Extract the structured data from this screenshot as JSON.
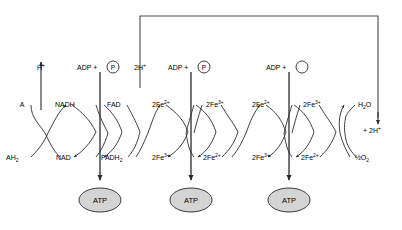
{
  "diagram": {
    "colors": {
      "stroke": "#2a2a2a",
      "atp_fill": "#d4d4d4",
      "atp_stroke": "#3a3a3a",
      "background": "#ffffff",
      "faint_text": "#b9b9b9"
    },
    "top_labels": {
      "proton_out": "H",
      "proton_out_sup": "+",
      "adp1": "ADP +",
      "adp1_circle": "P",
      "two_h": "2H",
      "two_h_sup": "+",
      "adp2": "ADP +",
      "adp2_circle": "P",
      "adp3": "ADP +",
      "adp3_circle": ""
    },
    "upper_row": [
      {
        "name": "A",
        "text": "A",
        "sup": "",
        "sub": ""
      },
      {
        "name": "NADH",
        "text": "NADH",
        "sup": "",
        "sub": ""
      },
      {
        "name": "FAD",
        "text": "FAD",
        "sup": "",
        "sub": ""
      },
      {
        "name": "2Fe2+ (a)",
        "text": "2Fe",
        "sup": "2+",
        "sub": ""
      },
      {
        "name": "2Fe3+ (b)",
        "text": "2Fe",
        "sup": "3+",
        "sub": ""
      },
      {
        "name": "2Fe2+ (c)",
        "text": "2Fe",
        "sup": "2+",
        "sub": ""
      },
      {
        "name": "2Fe3+ (d)",
        "text": "2Fe",
        "sup": "3+",
        "sub": ""
      },
      {
        "name": "H2O",
        "text": "H",
        "sup": "",
        "sub": "2"
      }
    ],
    "lower_row": [
      {
        "name": "AH2",
        "text": "AH",
        "sup": "",
        "sub": "2"
      },
      {
        "name": "NAD",
        "text": "NAD",
        "sup": "",
        "sub": ""
      },
      {
        "name": "FADH2",
        "text": "FADH",
        "sup": "",
        "sub": "2"
      },
      {
        "name": "2Fe3+ (a)",
        "text": "2Fe",
        "sup": "3+",
        "sub": ""
      },
      {
        "name": "2Fe2+ (b)",
        "text": "2Fe",
        "sup": "2+",
        "sub": ""
      },
      {
        "name": "2Fe3+ (c)",
        "text": "2Fe",
        "sup": "3+",
        "sub": ""
      },
      {
        "name": "2Fe2+ (d)",
        "text": "2Fe",
        "sup": "2+",
        "sub": ""
      },
      {
        "name": "half O2",
        "text": "½O",
        "sup": "",
        "sub": "2"
      }
    ],
    "water_label": {
      "text": "H",
      "sub": "2",
      "tail": "O"
    },
    "oxygen_label": {
      "text": "½O",
      "sub": "2"
    },
    "right_proton": {
      "prefix": "+",
      "text": "2H",
      "sup": "+"
    },
    "atp_nodes": [
      {
        "label": "ATP"
      },
      {
        "label": "ATP"
      },
      {
        "label": "ATP"
      }
    ],
    "corner_mark": ""
  }
}
